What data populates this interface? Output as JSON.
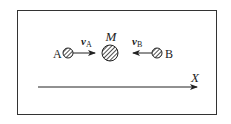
{
  "diagram": {
    "bodies": [
      {
        "id": "A",
        "label": "A",
        "size": "small"
      },
      {
        "id": "M",
        "label": "M",
        "size": "large"
      },
      {
        "id": "B",
        "label": "B",
        "size": "small"
      }
    ],
    "velocities": [
      {
        "id": "vA",
        "symbol": "v",
        "subscript": "A",
        "direction": "right"
      },
      {
        "id": "vB",
        "symbol": "v",
        "subscript": "B",
        "direction": "left"
      }
    ],
    "axis": {
      "label": "X",
      "direction": "right"
    },
    "colors": {
      "stroke": "#222222",
      "background": "#ffffff"
    }
  }
}
